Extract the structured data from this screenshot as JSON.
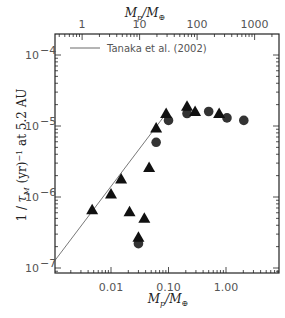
{
  "chart_data": {
    "type": "scatter",
    "title": "",
    "xlabel": "M_p/M_J",
    "xlabel_top": "M_p/M_⊕",
    "ylabel": "1/τ_M (yr)^-1 at 5.2 AU",
    "xscale": "log",
    "yscale": "log",
    "xlim": [
      0.001,
      8.4
    ],
    "ylim": [
      1e-07,
      0.00017
    ],
    "x_ticks": [
      {
        "value": 0.01,
        "label": "0.01"
      },
      {
        "value": 0.1,
        "label": "0.10"
      },
      {
        "value": 1,
        "label": "1.00"
      }
    ],
    "x_top_ticks": [
      {
        "value": 1,
        "label": "1"
      },
      {
        "value": 10,
        "label": "10"
      },
      {
        "value": 100,
        "label": "100"
      },
      {
        "value": 1000,
        "label": "1000"
      }
    ],
    "y_ticks": [
      {
        "value": 1e-07,
        "label": "10",
        "exp": "-7"
      },
      {
        "value": 1e-06,
        "label": "10",
        "exp": "-6"
      },
      {
        "value": 1e-05,
        "label": "10",
        "exp": "-5"
      },
      {
        "value": 0.0001,
        "label": "10",
        "exp": "-4"
      }
    ],
    "grid": false,
    "legend": {
      "position": "upper-left",
      "entries": [
        {
          "label": "Tanaka et al. (2002)",
          "style": "line"
        }
      ]
    },
    "series": [
      {
        "name": "Tanaka et al. (2002)",
        "type": "line",
        "x": [
          0.001,
          0.091
        ],
        "y": [
          1.2e-07,
          1.5e-05
        ]
      },
      {
        "name": "triangles",
        "marker": "triangle",
        "x": [
          0.0047,
          0.01,
          0.015,
          0.021,
          0.03,
          0.038,
          0.046,
          0.061,
          0.091,
          0.21,
          0.29,
          0.76
        ],
        "y": [
          6.6e-07,
          1.1e-06,
          1.8e-06,
          6.2e-07,
          2.7e-07,
          5e-07,
          2.6e-06,
          9.4e-06,
          1.5e-05,
          1.9e-05,
          1.6e-05,
          1.5e-05
        ]
      },
      {
        "name": "circles",
        "marker": "circle",
        "x": [
          0.03,
          0.061,
          0.1,
          0.21,
          0.5,
          1.04,
          2.04
        ],
        "y": [
          2.2e-07,
          5.9e-06,
          1.2e-05,
          1.5e-05,
          1.6e-05,
          1.3e-05,
          1.2e-05
        ]
      }
    ]
  },
  "labels": {
    "xlabel_bottom": "Mp/MJ",
    "xlabel_top": "Mp/M⊕",
    "ylabel": "1 / τM (yr)⁻¹ at 5.2 AU",
    "legend": "Tanaka et al. (2002)"
  }
}
